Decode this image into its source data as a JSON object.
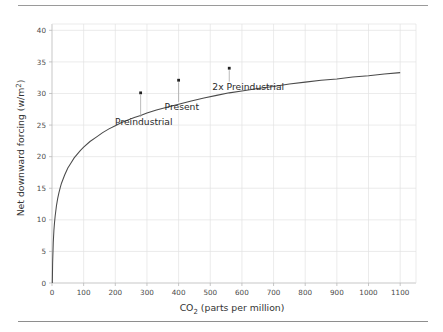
{
  "figure": {
    "rule_top": "",
    "rule_bottom": ""
  },
  "chart_data": {
    "type": "line",
    "title": "",
    "xlabel": "CO2 (parts per million)",
    "xlabel_base": "CO",
    "xlabel_sub": "2",
    "xlabel_rest": " (parts per million)",
    "ylabel": "Net downward forcing (w/m2)",
    "ylabel_base": "Net downward forcing (w/m",
    "ylabel_sup": "2",
    "ylabel_rest": ")",
    "xlim": [
      0,
      1150
    ],
    "ylim": [
      0,
      41
    ],
    "grid": true,
    "legend": "none",
    "xticks": [
      0,
      100,
      200,
      300,
      400,
      500,
      600,
      700,
      800,
      900,
      1000,
      1100
    ],
    "xtick_labels": [
      "0",
      "100",
      "200",
      "300",
      "400",
      "500",
      "600",
      "700",
      "800",
      "900",
      "1000",
      "1100"
    ],
    "yticks": [
      0,
      5,
      10,
      15,
      20,
      25,
      30,
      35,
      40
    ],
    "ytick_labels": [
      "0",
      "5",
      "10",
      "15",
      "20",
      "25",
      "30",
      "35",
      "40"
    ],
    "series": [
      {
        "name": "Net downward forcing",
        "color": "#4a4a4a",
        "x": [
          1,
          2,
          4,
          6,
          8,
          10,
          14,
          18,
          22,
          26,
          30,
          40,
          50,
          60,
          70,
          80,
          90,
          100,
          120,
          140,
          160,
          180,
          200,
          220,
          240,
          260,
          280,
          300,
          330,
          360,
          400,
          440,
          480,
          520,
          560,
          600,
          650,
          700,
          750,
          800,
          850,
          900,
          950,
          1000,
          1050,
          1100
        ],
        "y": [
          0.0,
          3.2,
          6.4,
          8.3,
          9.6,
          10.6,
          12.2,
          13.4,
          14.3,
          15.1,
          15.8,
          17.1,
          18.2,
          19.0,
          19.8,
          20.4,
          21.0,
          21.5,
          22.4,
          23.1,
          23.8,
          24.4,
          24.9,
          25.4,
          25.8,
          26.2,
          26.5,
          26.9,
          27.4,
          27.8,
          28.3,
          28.8,
          29.3,
          29.7,
          30.1,
          30.4,
          30.8,
          31.1,
          31.5,
          31.8,
          32.1,
          32.3,
          32.6,
          32.8,
          33.1,
          33.3
        ]
      }
    ],
    "annotations": [
      {
        "label": "Preindustrial",
        "x": 280,
        "y": 30.1,
        "text_x": 290,
        "text_y": 25.0,
        "anchor": "middle"
      },
      {
        "label": "Present",
        "x": 400,
        "y": 32.1,
        "text_x": 410,
        "text_y": 27.4,
        "anchor": "middle"
      },
      {
        "label": "2x Preindustrial",
        "x": 560,
        "y": 34.0,
        "text_x": 620,
        "text_y": 30.6,
        "anchor": "middle"
      }
    ]
  }
}
